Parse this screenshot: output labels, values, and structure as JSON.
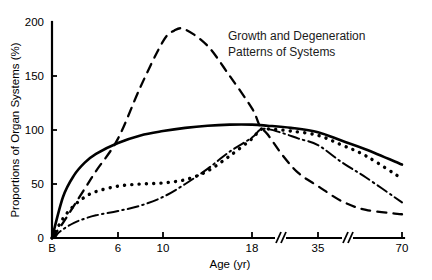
{
  "chart_data": {
    "type": "line",
    "title_line1": "Growth and Degeneration",
    "title_line2": "Patterns of Systems",
    "xlabel": "Age (yr)",
    "ylabel": "Proportions of Organ Systems (%)",
    "ylim": [
      0,
      200
    ],
    "yticks": [
      0,
      50,
      100,
      150,
      200
    ],
    "yticklabels": [
      "0",
      "50",
      "100",
      "150",
      "200"
    ],
    "xticklabels": [
      "B",
      "6",
      "10",
      "18",
      "35",
      "70"
    ],
    "xtickvalues": [
      0,
      6,
      10,
      18,
      35,
      70
    ],
    "x_axis_breaks": [
      22,
      45
    ],
    "x_axis_note": "broken axis: compressed after 18 and after 35",
    "grid": false,
    "legend": "none",
    "series": [
      {
        "name": "Solid curve",
        "style": "solid",
        "x": [
          0,
          1,
          2,
          3,
          4,
          6,
          8,
          10,
          12,
          14,
          16,
          18,
          22,
          28,
          35,
          45,
          55,
          70
        ],
        "values": [
          0,
          38,
          58,
          70,
          78,
          88,
          95,
          99,
          102,
          104,
          105,
          105,
          104,
          102,
          98,
          90,
          82,
          68
        ]
      },
      {
        "name": "Dashed curve",
        "style": "dashed",
        "x": [
          0,
          1,
          2,
          3,
          4,
          6,
          8,
          10,
          11,
          12,
          14,
          16,
          18,
          20,
          22,
          26,
          30,
          35,
          45,
          55,
          70
        ],
        "values": [
          0,
          14,
          30,
          46,
          62,
          92,
          140,
          182,
          192,
          193,
          178,
          150,
          120,
          104,
          96,
          76,
          60,
          48,
          34,
          26,
          22
        ]
      },
      {
        "name": "Dotted curve",
        "style": "dotted",
        "x": [
          0,
          1,
          2,
          3,
          4,
          6,
          8,
          10,
          12,
          14,
          16,
          18,
          20,
          22,
          28,
          35,
          45,
          55,
          70
        ],
        "values": [
          0,
          18,
          30,
          38,
          43,
          48,
          50,
          51,
          54,
          62,
          76,
          92,
          100,
          101,
          99,
          95,
          86,
          76,
          55
        ]
      },
      {
        "name": "Dash-dot curve",
        "style": "dashdot",
        "x": [
          0,
          1,
          2,
          3,
          4,
          6,
          8,
          10,
          12,
          14,
          16,
          18,
          20,
          22,
          26,
          30,
          35,
          45,
          55,
          70
        ],
        "values": [
          0,
          8,
          14,
          18,
          21,
          25,
          30,
          38,
          50,
          64,
          80,
          93,
          100,
          101,
          97,
          92,
          86,
          70,
          56,
          33
        ]
      }
    ]
  }
}
